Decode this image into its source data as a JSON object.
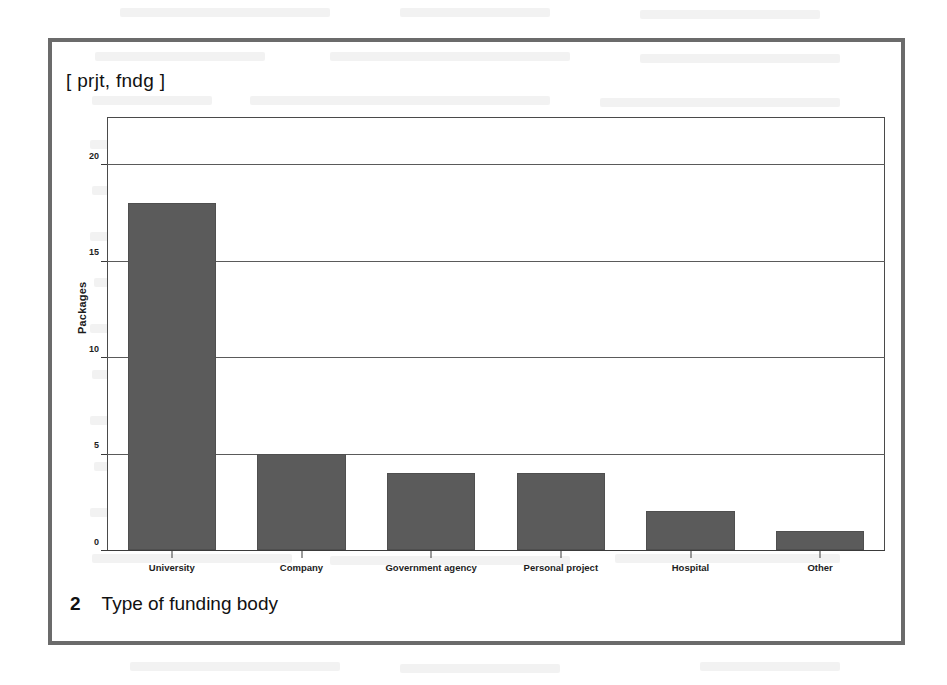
{
  "figure": {
    "title": "[ prjt, fndg ]",
    "caption_number": "2",
    "caption_text": "Type of funding body",
    "frame_color": "#6b6b6b"
  },
  "chart_data": {
    "type": "bar",
    "title": "[ prjt, fndg ]",
    "xlabel": "",
    "ylabel": "Packages",
    "categories": [
      "University",
      "Company",
      "Government agency",
      "Personal project",
      "Hospital",
      "Other"
    ],
    "values": [
      18,
      5,
      4,
      4,
      2,
      1
    ],
    "ylim": [
      0,
      22.5
    ],
    "yticks": [
      0,
      5,
      10,
      15,
      20
    ],
    "ytick_labels": [
      "0",
      "5",
      "10",
      "15",
      "20"
    ],
    "grid": true,
    "grid_axis": "y",
    "legend": null,
    "bar_color": "#5b5b5b",
    "bar_edge_color": "#4f4f4f"
  }
}
